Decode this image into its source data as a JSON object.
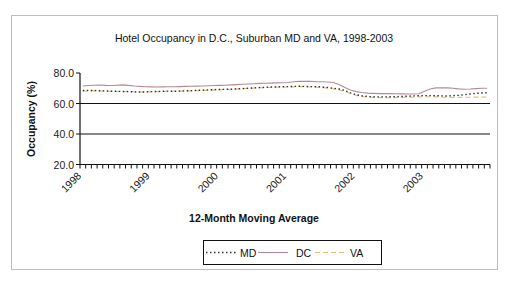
{
  "chart_data": {
    "type": "line",
    "title": "Hotel Occupancy in D.C., Suburban MD and VA, 1998-2003",
    "xlabel": "12-Month Moving Average",
    "ylabel": "Occupancy (%)",
    "ylim": [
      20,
      80
    ],
    "yticks": [
      "20.0",
      "40.0",
      "60.0",
      "80.0"
    ],
    "xticks": [
      "1998",
      "1999",
      "2000",
      "2001",
      "2002",
      "2003"
    ],
    "x_resolution": "monthly",
    "months": 72,
    "gridlines": [
      40,
      60
    ],
    "legend_position": "bottom",
    "series": [
      {
        "name": "MD",
        "color": "#333333",
        "style": "dotted",
        "values": [
          68.5,
          68.6,
          68.5,
          68.3,
          68.2,
          68.0,
          68.0,
          67.9,
          67.8,
          67.6,
          67.5,
          67.6,
          67.8,
          67.9,
          68.0,
          68.1,
          68.0,
          68.1,
          68.3,
          68.4,
          68.6,
          68.8,
          68.9,
          69.1,
          69.2,
          69.3,
          69.4,
          69.6,
          69.8,
          70.0,
          70.2,
          70.4,
          70.6,
          70.8,
          70.9,
          71.0,
          71.1,
          71.2,
          71.3,
          71.2,
          71.1,
          71.0,
          70.8,
          70.5,
          70.0,
          69.5,
          68.5,
          67.0,
          65.8,
          65.0,
          64.6,
          64.4,
          64.3,
          64.3,
          64.4,
          64.5,
          64.6,
          64.8,
          65.0,
          65.1,
          65.2,
          65.2,
          65.1,
          65.0,
          64.9,
          65.1,
          65.4,
          65.8,
          66.2,
          66.6,
          66.9,
          67.0
        ]
      },
      {
        "name": "DC",
        "color": "#b58a96",
        "style": "solid",
        "values": [
          71.5,
          71.8,
          72.0,
          72.1,
          71.9,
          71.8,
          72.0,
          72.2,
          71.9,
          71.5,
          71.2,
          71.0,
          70.9,
          70.8,
          70.9,
          71.0,
          71.0,
          71.1,
          71.2,
          71.3,
          71.4,
          71.5,
          71.6,
          71.8,
          71.9,
          72.0,
          72.2,
          72.4,
          72.6,
          72.8,
          73.0,
          73.2,
          73.3,
          73.4,
          73.5,
          73.6,
          73.8,
          74.2,
          74.5,
          74.6,
          74.5,
          74.3,
          74.2,
          74.1,
          73.8,
          72.5,
          70.5,
          68.8,
          67.8,
          67.2,
          66.8,
          66.6,
          66.5,
          66.5,
          66.5,
          66.4,
          66.3,
          66.2,
          66.2,
          66.4,
          68.0,
          69.5,
          70.2,
          70.3,
          70.2,
          70.0,
          69.6,
          69.4,
          69.5,
          69.8,
          70.0,
          70.0
        ]
      },
      {
        "name": "VA",
        "color": "#e8c078",
        "style": "dashed",
        "values": [
          68.0,
          68.2,
          68.3,
          68.2,
          68.1,
          68.0,
          67.9,
          67.8,
          67.8,
          67.7,
          67.6,
          67.6,
          67.7,
          67.8,
          67.9,
          68.0,
          68.0,
          68.1,
          68.2,
          68.3,
          68.4,
          68.5,
          68.6,
          68.8,
          69.0,
          69.2,
          69.3,
          69.5,
          69.7,
          69.9,
          70.1,
          70.3,
          70.4,
          70.5,
          70.6,
          70.7,
          70.8,
          70.9,
          71.0,
          70.9,
          70.8,
          70.6,
          70.4,
          70.1,
          69.6,
          68.9,
          67.8,
          66.5,
          65.3,
          64.6,
          64.2,
          64.0,
          63.9,
          63.8,
          63.8,
          63.9,
          64.0,
          64.1,
          64.2,
          64.3,
          64.4,
          64.4,
          64.3,
          64.2,
          64.1,
          64.0,
          64.0,
          64.0,
          64.1,
          64.2,
          64.2,
          64.3
        ]
      }
    ]
  }
}
